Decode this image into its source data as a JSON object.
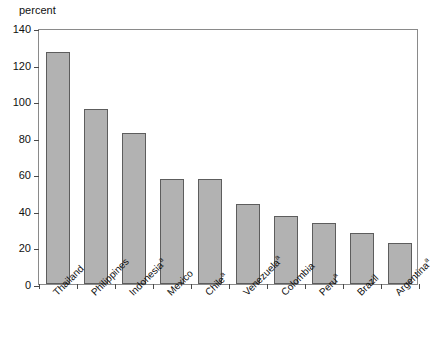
{
  "chart_data": {
    "type": "bar",
    "title": "",
    "subtitle": "",
    "xlabel": "",
    "ylabel": "percent",
    "ylim": [
      0,
      140
    ],
    "ytick_values": [
      0,
      20,
      40,
      60,
      80,
      100,
      120,
      140
    ],
    "ytick_labels": [
      "0",
      "20",
      "40",
      "60",
      "80",
      "100",
      "120",
      "140"
    ],
    "grid": false,
    "legend": null,
    "categories": [
      "Thailand",
      "Philippines",
      "Indonesia",
      "Mexico",
      "Chile",
      "Venezuela",
      "Colombia",
      "Peru",
      "Brazil",
      "Argentina"
    ],
    "category_footnotes": [
      "",
      "",
      "a",
      "",
      "a",
      "a",
      "",
      "a",
      "",
      "a"
    ],
    "values": [
      127,
      95.5,
      82.5,
      57.5,
      57.5,
      44,
      37,
      33.5,
      28,
      22.5
    ],
    "bar_color": "#b2b2b2",
    "bar_border_color": "#5d5d5d",
    "axis_color": "#8a8a8a",
    "text_color": "#111111"
  }
}
